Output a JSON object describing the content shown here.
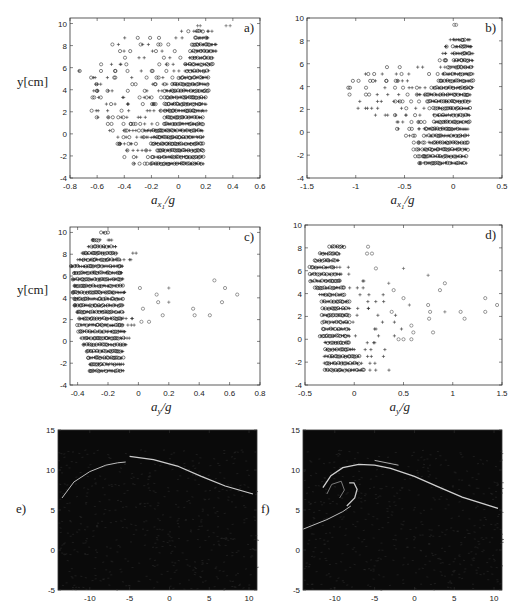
{
  "figure": {
    "panels": [
      {
        "id": "a",
        "label": "a)",
        "xlabel_base": "a",
        "xlabel_sub": "x",
        "xlabel_subsub": "1",
        "xlabel_tail": "/g",
        "ylabel": "y[cm]",
        "xticks": [
          "-0.8",
          "-0.6",
          "-0.4",
          "-0.2",
          "0",
          "0.2",
          "0.4",
          "0.6"
        ],
        "yticks": [
          "10",
          "8",
          "6",
          "4",
          "2",
          "0",
          "-2",
          "-4"
        ]
      },
      {
        "id": "b",
        "label": "b)",
        "xlabel_base": "a",
        "xlabel_sub": "x",
        "xlabel_subsub": "1",
        "xlabel_tail": "/g",
        "ylabel": "",
        "xticks": [
          "-1.5",
          "-1",
          "-0.5",
          "0",
          "0.5"
        ],
        "yticks": [
          "10",
          "8",
          "6",
          "4",
          "2",
          "0",
          "-2",
          "-4"
        ]
      },
      {
        "id": "c",
        "label": "c)",
        "xlabel_base": "a",
        "xlabel_sub": "y",
        "xlabel_tail": "/g",
        "ylabel": "y[cm]",
        "xticks": [
          "-0.4",
          "-0.2",
          "0",
          "0.2",
          "0.4",
          "0.6",
          "0.8"
        ],
        "yticks": [
          "10",
          "8",
          "6",
          "4",
          "2",
          "0",
          "-2",
          "-4"
        ]
      },
      {
        "id": "d",
        "label": "d)",
        "xlabel_base": "a",
        "xlabel_sub": "y",
        "xlabel_tail": "/g",
        "ylabel": "",
        "xticks": [
          "-0.5",
          "0",
          "0.5",
          "1",
          "1.5"
        ],
        "yticks": [
          "10",
          "8",
          "6",
          "4",
          "2",
          "0",
          "-2",
          "-4"
        ]
      },
      {
        "id": "e",
        "label": "e)",
        "xticks": [
          "-10",
          "-5",
          "0",
          "5",
          "10"
        ],
        "yticks": [
          "15",
          "10",
          "5",
          "0",
          "-5"
        ]
      },
      {
        "id": "f",
        "label": "f)",
        "xticks": [
          "-10",
          "-5",
          "0",
          "5",
          "10"
        ],
        "yticks": [
          "15",
          "10",
          "5",
          "0",
          "-5"
        ]
      }
    ]
  },
  "chart_data": [
    {
      "type": "scatter",
      "title": "a)",
      "xlabel": "a_{x1}/g",
      "ylabel": "y[cm]",
      "xlim": [
        -0.8,
        0.6
      ],
      "ylim": [
        -4,
        10.5
      ],
      "grid": false,
      "series": [
        {
          "name": "circles",
          "marker": "o"
        },
        {
          "name": "pluses",
          "marker": "+"
        }
      ],
      "description": "Rows of points at y from -3 to 10; dense cluster near a_x1/g 0 to 0.2; spread to -0.7 at mid heights"
    },
    {
      "type": "scatter",
      "title": "b)",
      "xlabel": "a_{x1}/g",
      "ylabel": "",
      "xlim": [
        -1.5,
        0.5
      ],
      "ylim": [
        -4,
        10
      ],
      "grid": false,
      "series": [
        {
          "name": "circles",
          "marker": "o"
        },
        {
          "name": "pluses",
          "marker": "+"
        }
      ],
      "description": "Dense cluster -0.2 to 0.15; sparse circles to -1.1 at y 1-5; top point near y 9.5 at 0"
    },
    {
      "type": "scatter",
      "title": "c)",
      "xlabel": "a_y/g",
      "ylabel": "y[cm]",
      "xlim": [
        -0.45,
        0.8
      ],
      "ylim": [
        -4,
        10.5
      ],
      "grid": false,
      "series": [
        {
          "name": "circles",
          "marker": "o"
        },
        {
          "name": "pluses",
          "marker": "+"
        }
      ],
      "description": "Dense cluster -0.4 to -0.1; outliers up to 0.65 at y 2-5"
    },
    {
      "type": "scatter",
      "title": "d)",
      "xlabel": "a_y/g",
      "ylabel": "",
      "xlim": [
        -0.5,
        1.5
      ],
      "ylim": [
        -4,
        10
      ],
      "grid": false,
      "series": [
        {
          "name": "circles",
          "marker": "o"
        },
        {
          "name": "pluses",
          "marker": "+"
        }
      ],
      "description": "Dense cluster -0.45 to 0; outliers up to 1.45 at y ~3"
    },
    {
      "type": "heatmap",
      "title": "e)",
      "xlim": [
        -14,
        11
      ],
      "ylim": [
        -5,
        15
      ],
      "description": "Wave profile image, crest near x=-5 y=11.5"
    },
    {
      "type": "heatmap",
      "title": "f)",
      "xlim": [
        -14,
        11
      ],
      "ylim": [
        -5,
        15
      ],
      "description": "Overturning breaking wave, plunging jet near x=-9 y=7"
    }
  ]
}
